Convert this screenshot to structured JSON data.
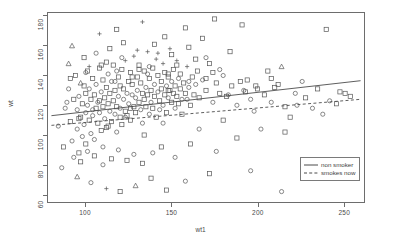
{
  "chart_data": {
    "type": "scatter",
    "title": "",
    "xlabel": "wt1",
    "ylabel": "wt",
    "xlim": [
      78,
      262
    ],
    "ylim": [
      55,
      182
    ],
    "xticks": [
      100,
      150,
      200,
      250
    ],
    "yticks": [
      60,
      80,
      100,
      120,
      140,
      160,
      180
    ],
    "grid": false,
    "legend_position": "bottom-right-inside",
    "legend": [
      {
        "label": "non smoker",
        "style": "solid"
      },
      {
        "label": "smokes now",
        "style": "dashed"
      }
    ],
    "marker_shapes": [
      "circle",
      "square",
      "plus",
      "triangle"
    ],
    "series": [
      {
        "name": "non smoker",
        "line": {
          "style": "solid",
          "x": [
            80,
            260
          ],
          "y": [
            113.0,
            136.5
          ]
        }
      },
      {
        "name": "smokes now",
        "line": {
          "style": "dashed",
          "x": [
            80,
            260
          ],
          "y": [
            106.5,
            124.0
          ]
        }
      }
    ],
    "points": [
      [
        88,
        118,
        "c"
      ],
      [
        90,
        131,
        "c"
      ],
      [
        91,
        109,
        "s"
      ],
      [
        92,
        96,
        "c"
      ],
      [
        93,
        124,
        "s"
      ],
      [
        94,
        140,
        "s"
      ],
      [
        95,
        104,
        "c"
      ],
      [
        95,
        117,
        "c"
      ],
      [
        96,
        88,
        "s"
      ],
      [
        96,
        126,
        "c"
      ],
      [
        97,
        135,
        "t"
      ],
      [
        97,
        112,
        "s"
      ],
      [
        98,
        99,
        "c"
      ],
      [
        98,
        121,
        "s"
      ],
      [
        99,
        133,
        "s"
      ],
      [
        99,
        107,
        "c"
      ],
      [
        100,
        115,
        "c"
      ],
      [
        100,
        128,
        "s"
      ],
      [
        100,
        94,
        "s"
      ],
      [
        101,
        120,
        "c"
      ],
      [
        101,
        143,
        "s"
      ],
      [
        102,
        110,
        "s"
      ],
      [
        102,
        131,
        "c"
      ],
      [
        103,
        101,
        "c"
      ],
      [
        103,
        124,
        "s"
      ],
      [
        104,
        138,
        "s"
      ],
      [
        104,
        113,
        "c"
      ],
      [
        105,
        127,
        "s"
      ],
      [
        105,
        97,
        "c"
      ],
      [
        106,
        118,
        "s"
      ],
      [
        106,
        134,
        "c"
      ],
      [
        107,
        108,
        "s"
      ],
      [
        107,
        122,
        "c"
      ],
      [
        108,
        145,
        "s"
      ],
      [
        108,
        115,
        "c"
      ],
      [
        109,
        103,
        "s"
      ],
      [
        109,
        129,
        "c"
      ],
      [
        110,
        119,
        "s"
      ],
      [
        110,
        137,
        "s"
      ],
      [
        110,
        92,
        "c"
      ],
      [
        111,
        125,
        "s"
      ],
      [
        111,
        111,
        "c"
      ],
      [
        112,
        132,
        "s"
      ],
      [
        112,
        105,
        "s"
      ],
      [
        113,
        141,
        "c"
      ],
      [
        113,
        121,
        "s"
      ],
      [
        114,
        116,
        "c"
      ],
      [
        114,
        128,
        "s"
      ],
      [
        115,
        109,
        "s"
      ],
      [
        115,
        136,
        "c"
      ],
      [
        116,
        123,
        "s"
      ],
      [
        116,
        147,
        "s"
      ],
      [
        117,
        114,
        "c"
      ],
      [
        117,
        130,
        "s"
      ],
      [
        118,
        119,
        "s"
      ],
      [
        118,
        102,
        "c"
      ],
      [
        119,
        139,
        "s"
      ],
      [
        119,
        126,
        "c"
      ],
      [
        120,
        112,
        "s"
      ],
      [
        120,
        133,
        "s"
      ],
      [
        120,
        118,
        "c"
      ],
      [
        121,
        144,
        "s"
      ],
      [
        121,
        107,
        "s"
      ],
      [
        122,
        124,
        "c"
      ],
      [
        122,
        131,
        "s"
      ],
      [
        123,
        116,
        "s"
      ],
      [
        123,
        150,
        "p"
      ],
      [
        124,
        128,
        "c"
      ],
      [
        124,
        113,
        "s"
      ],
      [
        125,
        136,
        "s"
      ],
      [
        125,
        121,
        "c"
      ],
      [
        126,
        142,
        "s"
      ],
      [
        126,
        110,
        "s"
      ],
      [
        127,
        127,
        "c"
      ],
      [
        127,
        134,
        "s"
      ],
      [
        128,
        119,
        "s"
      ],
      [
        128,
        153,
        "p"
      ],
      [
        129,
        125,
        "c"
      ],
      [
        129,
        115,
        "s"
      ],
      [
        130,
        139,
        "s"
      ],
      [
        130,
        130,
        "c"
      ],
      [
        131,
        122,
        "s"
      ],
      [
        131,
        147,
        "s"
      ],
      [
        132,
        117,
        "c"
      ],
      [
        132,
        135,
        "s"
      ],
      [
        133,
        128,
        "s"
      ],
      [
        133,
        108,
        "c"
      ],
      [
        134,
        143,
        "s"
      ],
      [
        134,
        124,
        "s"
      ],
      [
        135,
        132,
        "c"
      ],
      [
        135,
        119,
        "s"
      ],
      [
        136,
        156,
        "p"
      ],
      [
        136,
        127,
        "s"
      ],
      [
        137,
        114,
        "c"
      ],
      [
        137,
        138,
        "s"
      ],
      [
        138,
        130,
        "s"
      ],
      [
        138,
        122,
        "c"
      ],
      [
        139,
        145,
        "s"
      ],
      [
        139,
        118,
        "s"
      ],
      [
        140,
        134,
        "c"
      ],
      [
        140,
        126,
        "s"
      ],
      [
        141,
        151,
        "p"
      ],
      [
        141,
        112,
        "s"
      ],
      [
        142,
        129,
        "c"
      ],
      [
        142,
        140,
        "s"
      ],
      [
        143,
        123,
        "s"
      ],
      [
        143,
        117,
        "c"
      ],
      [
        144,
        136,
        "s"
      ],
      [
        144,
        131,
        "s"
      ],
      [
        145,
        148,
        "p"
      ],
      [
        145,
        120,
        "c"
      ],
      [
        146,
        127,
        "s"
      ],
      [
        146,
        142,
        "s"
      ],
      [
        147,
        133,
        "c"
      ],
      [
        147,
        115,
        "s"
      ],
      [
        148,
        139,
        "s"
      ],
      [
        148,
        125,
        "c"
      ],
      [
        149,
        130,
        "s"
      ],
      [
        149,
        158,
        "p"
      ],
      [
        150,
        122,
        "s"
      ],
      [
        150,
        136,
        "c"
      ],
      [
        151,
        128,
        "s"
      ],
      [
        151,
        144,
        "s"
      ],
      [
        152,
        118,
        "c"
      ],
      [
        152,
        133,
        "s"
      ],
      [
        153,
        126,
        "s"
      ],
      [
        153,
        150,
        "p"
      ],
      [
        154,
        138,
        "c"
      ],
      [
        154,
        121,
        "s"
      ],
      [
        155,
        131,
        "s"
      ],
      [
        155,
        141,
        "s"
      ],
      [
        156,
        124,
        "c"
      ],
      [
        157,
        135,
        "s"
      ],
      [
        158,
        128,
        "s"
      ],
      [
        159,
        146,
        "p"
      ],
      [
        160,
        132,
        "c"
      ],
      [
        161,
        120,
        "s"
      ],
      [
        162,
        139,
        "s"
      ],
      [
        163,
        127,
        "s"
      ],
      [
        164,
        134,
        "c"
      ],
      [
        165,
        143,
        "s"
      ],
      [
        166,
        125,
        "s"
      ],
      [
        168,
        137,
        "c"
      ],
      [
        170,
        130,
        "s"
      ],
      [
        172,
        148,
        "s"
      ],
      [
        174,
        122,
        "c"
      ],
      [
        176,
        135,
        "s"
      ],
      [
        178,
        128,
        "s"
      ],
      [
        180,
        140,
        "c"
      ],
      [
        182,
        126,
        "s"
      ],
      [
        185,
        133,
        "s"
      ],
      [
        188,
        120,
        "c"
      ],
      [
        190,
        136,
        "s"
      ],
      [
        193,
        129,
        "s"
      ],
      [
        196,
        124,
        "c"
      ],
      [
        200,
        131,
        "s"
      ],
      [
        204,
        127,
        "s"
      ],
      [
        208,
        122,
        "c"
      ],
      [
        212,
        134,
        "s"
      ],
      [
        216,
        119,
        "s"
      ],
      [
        222,
        128,
        "c"
      ],
      [
        228,
        125,
        "s"
      ],
      [
        235,
        131,
        "s"
      ],
      [
        242,
        123,
        "c"
      ],
      [
        248,
        129,
        "s"
      ],
      [
        254,
        126,
        "s"
      ],
      [
        92,
        160,
        "t"
      ],
      [
        108,
        168,
        "p"
      ],
      [
        118,
        171,
        "s"
      ],
      [
        133,
        176,
        "p"
      ],
      [
        146,
        166,
        "s"
      ],
      [
        158,
        172,
        "s"
      ],
      [
        168,
        165,
        "s"
      ],
      [
        175,
        178,
        "s"
      ],
      [
        191,
        174,
        "s"
      ],
      [
        214,
        146,
        "t"
      ],
      [
        240,
        171,
        "s"
      ],
      [
        86,
        78,
        "c"
      ],
      [
        95,
        72,
        "t"
      ],
      [
        103,
        68,
        "c"
      ],
      [
        112,
        64,
        "p"
      ],
      [
        120,
        62,
        "s"
      ],
      [
        129,
        66,
        "t"
      ],
      [
        138,
        71,
        "s"
      ],
      [
        147,
        63,
        "s"
      ],
      [
        158,
        69,
        "c"
      ],
      [
        172,
        74,
        "s"
      ],
      [
        196,
        76,
        "c"
      ],
      [
        214,
        62,
        "c"
      ],
      [
        90,
        148,
        "t"
      ],
      [
        99,
        152,
        "s"
      ],
      [
        106,
        155,
        "c"
      ],
      [
        114,
        158,
        "s"
      ],
      [
        122,
        162,
        "s"
      ],
      [
        130,
        157,
        "p"
      ],
      [
        140,
        161,
        "s"
      ],
      [
        150,
        154,
        "s"
      ],
      [
        160,
        159,
        "s"
      ],
      [
        170,
        152,
        "c"
      ],
      [
        184,
        156,
        "s"
      ],
      [
        206,
        143,
        "s"
      ],
      [
        84,
        106,
        "c"
      ],
      [
        87,
        92,
        "s"
      ],
      [
        89,
        122,
        "c"
      ],
      [
        93,
        85,
        "c"
      ],
      [
        97,
        82,
        "s"
      ],
      [
        101,
        89,
        "c"
      ],
      [
        105,
        86,
        "s"
      ],
      [
        110,
        80,
        "c"
      ],
      [
        115,
        84,
        "s"
      ],
      [
        119,
        90,
        "c"
      ],
      [
        124,
        83,
        "s"
      ],
      [
        128,
        87,
        "c"
      ],
      [
        133,
        81,
        "s"
      ],
      [
        139,
        88,
        "c"
      ],
      [
        144,
        92,
        "s"
      ],
      [
        152,
        85,
        "c"
      ],
      [
        161,
        94,
        "s"
      ],
      [
        176,
        89,
        "c"
      ],
      [
        188,
        98,
        "s"
      ],
      [
        202,
        104,
        "c"
      ],
      [
        219,
        112,
        "s"
      ],
      [
        232,
        118,
        "c"
      ],
      [
        246,
        121,
        "s"
      ],
      [
        102,
        146,
        "p"
      ],
      [
        112,
        149,
        "s"
      ],
      [
        121,
        152,
        "c"
      ],
      [
        131,
        144,
        "s"
      ],
      [
        142,
        155,
        "p"
      ],
      [
        153,
        147,
        "s"
      ],
      [
        164,
        151,
        "s"
      ],
      [
        178,
        144,
        "c"
      ],
      [
        194,
        137,
        "s"
      ],
      [
        210,
        132,
        "s"
      ],
      [
        226,
        136,
        "c"
      ],
      [
        96,
        111,
        "s"
      ],
      [
        104,
        117,
        "c"
      ],
      [
        113,
        106,
        "s"
      ],
      [
        123,
        112,
        "c"
      ],
      [
        134,
        100,
        "s"
      ],
      [
        145,
        108,
        "c"
      ],
      [
        156,
        114,
        "s"
      ],
      [
        166,
        104,
        "c"
      ],
      [
        180,
        110,
        "s"
      ],
      [
        198,
        116,
        "c"
      ],
      [
        216,
        102,
        "s"
      ],
      [
        238,
        114,
        "c"
      ],
      [
        108,
        123,
        "s"
      ],
      [
        117,
        136,
        "c"
      ],
      [
        126,
        118,
        "s"
      ],
      [
        136,
        141,
        "c"
      ],
      [
        148,
        130,
        "s"
      ],
      [
        159,
        124,
        "c"
      ],
      [
        170,
        138,
        "s"
      ],
      [
        183,
        127,
        "c"
      ],
      [
        199,
        133,
        "s"
      ],
      [
        223,
        120,
        "c"
      ],
      [
        251,
        128,
        "s"
      ],
      [
        91,
        138,
        "s"
      ],
      [
        100,
        142,
        "c"
      ],
      [
        109,
        147,
        "s"
      ],
      [
        118,
        143,
        "c"
      ],
      [
        127,
        139,
        "s"
      ],
      [
        137,
        146,
        "c"
      ],
      [
        148,
        141,
        "s"
      ],
      [
        160,
        136,
        "c"
      ],
      [
        174,
        142,
        "s"
      ],
      [
        192,
        130,
        "c"
      ],
      [
        208,
        138,
        "s"
      ]
    ]
  }
}
